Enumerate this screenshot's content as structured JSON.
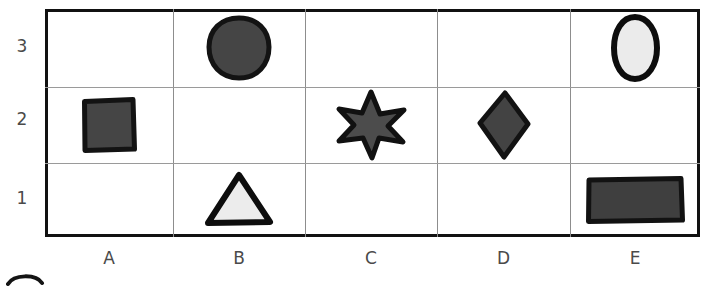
{
  "worksheet": {
    "title": "shape-grid-worksheet",
    "columns": [
      "A",
      "B",
      "C",
      "D",
      "E"
    ],
    "rows": [
      "3",
      "2",
      "1"
    ],
    "colors": {
      "dark_fill": "#454545",
      "dark_outline": "#111111",
      "light_fill": "#e9e9e9",
      "light_outline": "#111111",
      "grid_border": "#111111",
      "grid_line": "#9a9a9a",
      "label_text": "#4a4a4a",
      "background": "#ffffff"
    },
    "cells": [
      {
        "id": "a2",
        "column": "A",
        "row": "2",
        "shape": "square",
        "fill": "dark"
      },
      {
        "id": "b3",
        "column": "B",
        "row": "3",
        "shape": "circle",
        "fill": "dark"
      },
      {
        "id": "b1",
        "column": "B",
        "row": "1",
        "shape": "triangle",
        "fill": "light"
      },
      {
        "id": "c2",
        "column": "C",
        "row": "2",
        "shape": "star",
        "fill": "dark"
      },
      {
        "id": "d2",
        "column": "D",
        "row": "2",
        "shape": "diamond",
        "fill": "dark"
      },
      {
        "id": "e3",
        "column": "E",
        "row": "3",
        "shape": "ellipse",
        "fill": "light"
      },
      {
        "id": "e1",
        "column": "E",
        "row": "1",
        "shape": "rectangle",
        "fill": "dark"
      }
    ],
    "partial_mark": "cut-off-arc"
  }
}
